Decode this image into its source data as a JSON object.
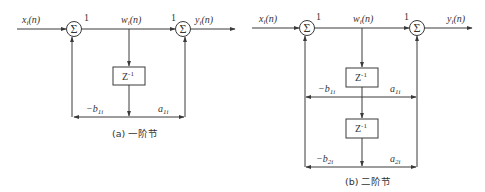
{
  "diagrams": {
    "a": {
      "input_label": "x_i(n)",
      "input_base": "x",
      "input_sub": "i",
      "input_arg": "(n)",
      "mid_label_base": "w",
      "mid_label_sub": "i",
      "mid_label_arg": "(n)",
      "output_base": "y",
      "output_sub": "i",
      "output_arg": "(n)",
      "gain_left": "1",
      "gain_right": "1",
      "sum_symbol": "Σ",
      "delay": {
        "base": "Z",
        "exp": "-1"
      },
      "coef_b": {
        "prefix": "−b",
        "sub": "1i"
      },
      "coef_a": {
        "prefix": "a",
        "sub": "1i"
      },
      "caption": "(a) 一阶节"
    },
    "b": {
      "input_base": "x",
      "input_sub": "i",
      "input_arg": "(n)",
      "mid_label_base": "w",
      "mid_label_sub": "i",
      "mid_label_arg": "(n)",
      "output_base": "y",
      "output_sub": "i",
      "output_arg": "(n)",
      "gain_left": "1",
      "gain_right": "1",
      "sum_symbol": "Σ",
      "delay1": {
        "base": "Z",
        "exp": "-1"
      },
      "delay2": {
        "base": "Z",
        "exp": "-1"
      },
      "coef_b1": {
        "prefix": "−b",
        "sub": "1i"
      },
      "coef_a1": {
        "prefix": "a",
        "sub": "1i"
      },
      "coef_b2": {
        "prefix": "−b",
        "sub": "2i"
      },
      "coef_a2": {
        "prefix": "a",
        "sub": "2i"
      },
      "caption": "(b) 二阶节"
    }
  }
}
